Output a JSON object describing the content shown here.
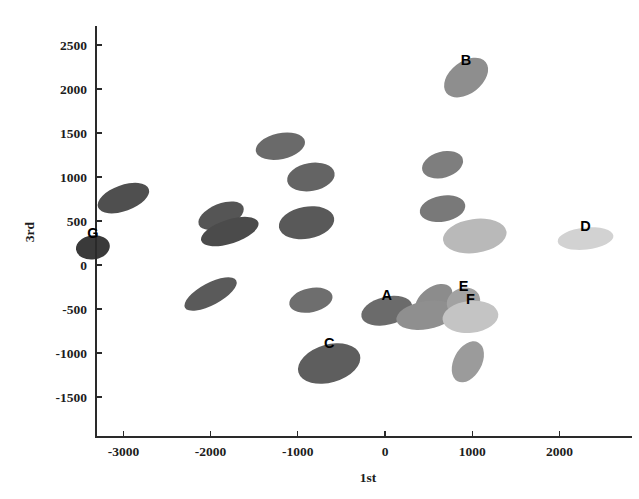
{
  "chart_data": {
    "type": "scatter",
    "title": "",
    "xlabel": "1st",
    "ylabel": "3rd",
    "xlim": [
      -3500,
      2600
    ],
    "ylim": [
      -1750,
      2750
    ],
    "grid": false,
    "legend": "none",
    "xticks": [
      -3000,
      -2000,
      -1000,
      0,
      1000,
      2000
    ],
    "xtick_labels": [
      "-3000",
      "-2000",
      "-1000",
      "0",
      "1000",
      "2000"
    ],
    "yticks": [
      -1500,
      -1000,
      -500,
      0,
      500,
      1000,
      1500,
      2000,
      2500
    ],
    "ytick_labels": [
      "-1500",
      "-1000",
      "-500",
      "0",
      "500",
      "1000",
      "1500",
      "2000",
      "2500"
    ],
    "marker_style": "rotated filled ellipse, grayscale shading",
    "points": [
      {
        "label": "G",
        "x": -3350,
        "y": 200,
        "rx": 17,
        "ry": 12,
        "angle": -8,
        "gray": "#3a3a3a"
      },
      {
        "label": "",
        "x": -3000,
        "y": 760,
        "rx": 27,
        "ry": 13,
        "angle": -20,
        "gray": "#4f4f4f"
      },
      {
        "label": "",
        "x": -2000,
        "y": -330,
        "rx": 29,
        "ry": 11,
        "angle": -28,
        "gray": "#5a5a5a"
      },
      {
        "label": "",
        "x": -1880,
        "y": 560,
        "rx": 24,
        "ry": 12,
        "angle": -22,
        "gray": "#555555"
      },
      {
        "label": "",
        "x": -1780,
        "y": 380,
        "rx": 30,
        "ry": 12,
        "angle": -18,
        "gray": "#4b4b4b"
      },
      {
        "label": "",
        "x": -1200,
        "y": 1350,
        "rx": 25,
        "ry": 13,
        "angle": -12,
        "gray": "#6a6a6a"
      },
      {
        "label": "",
        "x": -850,
        "y": 1000,
        "rx": 24,
        "ry": 14,
        "angle": -10,
        "gray": "#646464"
      },
      {
        "label": "",
        "x": -900,
        "y": 480,
        "rx": 28,
        "ry": 16,
        "angle": -10,
        "gray": "#595959"
      },
      {
        "label": "",
        "x": -850,
        "y": -400,
        "rx": 22,
        "ry": 12,
        "angle": -12,
        "gray": "#6e6e6e"
      },
      {
        "label": "C",
        "x": -640,
        "y": -1120,
        "rx": 32,
        "ry": 19,
        "angle": -16,
        "gray": "#5e5e5e"
      },
      {
        "label": "A",
        "x": 20,
        "y": -520,
        "rx": 26,
        "ry": 14,
        "angle": -14,
        "gray": "#6b6b6b"
      },
      {
        "label": "B",
        "x": 930,
        "y": 2130,
        "rx": 25,
        "ry": 16,
        "angle": -38,
        "gray": "#8e8e8e"
      },
      {
        "label": "",
        "x": 660,
        "y": 1140,
        "rx": 21,
        "ry": 13,
        "angle": -16,
        "gray": "#7e7e7e"
      },
      {
        "label": "",
        "x": 660,
        "y": 640,
        "rx": 23,
        "ry": 13,
        "angle": -10,
        "gray": "#797979"
      },
      {
        "label": "",
        "x": 560,
        "y": -400,
        "rx": 21,
        "ry": 13,
        "angle": -36,
        "gray": "#8c8c8c"
      },
      {
        "label": "",
        "x": 470,
        "y": -570,
        "rx": 30,
        "ry": 14,
        "angle": -10,
        "gray": "#8f8f8f"
      },
      {
        "label": "E",
        "x": 900,
        "y": -420,
        "rx": 17,
        "ry": 14,
        "angle": -20,
        "gray": "#a2a2a2"
      },
      {
        "label": "F",
        "x": 980,
        "y": -590,
        "rx": 28,
        "ry": 16,
        "angle": -6,
        "gray": "#c4c4c4"
      },
      {
        "label": "",
        "x": 1030,
        "y": 330,
        "rx": 32,
        "ry": 17,
        "angle": -8,
        "gray": "#b9b9b9"
      },
      {
        "label": "D",
        "x": 2300,
        "y": 300,
        "rx": 28,
        "ry": 11,
        "angle": -6,
        "gray": "#d2d2d2"
      },
      {
        "label": "",
        "x": 950,
        "y": -1100,
        "rx": 14,
        "ry": 22,
        "angle": 28,
        "gray": "#9b9b9b"
      }
    ]
  }
}
